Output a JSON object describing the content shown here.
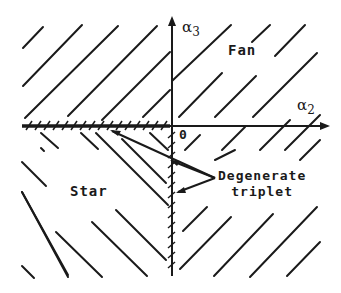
{
  "diagram": {
    "regions": {
      "fan": "Fan",
      "star": "Star"
    },
    "axes": {
      "horizontal": {
        "symbol": "α",
        "subscript": "2"
      },
      "vertical": {
        "symbol": "α",
        "subscript": "3"
      },
      "origin": "0"
    },
    "annotation": {
      "line1": "Degenerate",
      "line2": "triplet"
    },
    "colors": {
      "ink": "#1a1a1a",
      "background": "#ffffff"
    }
  }
}
